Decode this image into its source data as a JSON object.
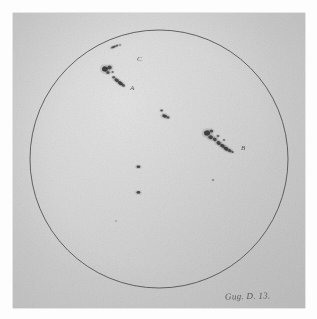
{
  "plate": {
    "kind": "astronomical-drawing",
    "subject": "Solar disk with sunspot groups",
    "paper_tone": "#d2d2d2",
    "ink_color": "#3a3a3a"
  },
  "disk": {
    "label": "solar-disk",
    "center_x": 159,
    "center_y": 159,
    "radius": 129,
    "stroke_color": "#4a4a4a",
    "stroke_width": 0.9
  },
  "annotations": {
    "signature": "Gug. D. 13.",
    "labels": [
      {
        "id": "C",
        "text": "C"
      },
      {
        "id": "A",
        "text": "A"
      },
      {
        "id": "B",
        "text": "B"
      }
    ]
  },
  "chart_data": {
    "type": "scatter",
    "xlabel": "",
    "ylabel": "",
    "xlim": [
      -1,
      1
    ],
    "ylim": [
      -1,
      1
    ],
    "grid": false,
    "legend": "none",
    "disk": {
      "cx": 159,
      "cy": 159,
      "r": 129
    },
    "groups": [
      {
        "name": "C",
        "label": "C",
        "label_x": 124,
        "label_y": 45,
        "spots": [
          {
            "x": 113.5,
            "y": 47.0,
            "rx": 2.6,
            "ry": 1.1,
            "rot": -22,
            "darkness": 0.82
          },
          {
            "x": 117.0,
            "y": 45.6,
            "rx": 1.3,
            "ry": 0.9,
            "rot": -20,
            "darkness": 0.7
          },
          {
            "x": 120.0,
            "y": 45.0,
            "rx": 1.0,
            "ry": 0.8,
            "rot": 0,
            "darkness": 0.6
          }
        ]
      },
      {
        "name": "A",
        "label": "A",
        "label_x": 117,
        "label_y": 74,
        "spots": [
          {
            "x": 105.0,
            "y": 69.0,
            "rx": 3.0,
            "ry": 2.7,
            "rot": 15,
            "darkness": 0.95
          },
          {
            "x": 109.6,
            "y": 67.5,
            "rx": 2.1,
            "ry": 1.9,
            "rot": 0,
            "darkness": 0.88
          },
          {
            "x": 108.0,
            "y": 72.4,
            "rx": 1.7,
            "ry": 1.5,
            "rot": 0,
            "darkness": 0.8
          },
          {
            "x": 112.6,
            "y": 72.0,
            "rx": 1.2,
            "ry": 1.1,
            "rot": 0,
            "darkness": 0.62
          },
          {
            "x": 113.6,
            "y": 77.3,
            "rx": 1.5,
            "ry": 1.2,
            "rot": 0,
            "darkness": 0.7
          },
          {
            "x": 116.6,
            "y": 80.2,
            "rx": 2.4,
            "ry": 1.6,
            "rot": 30,
            "darkness": 0.9
          },
          {
            "x": 120.4,
            "y": 83.2,
            "rx": 2.7,
            "ry": 1.7,
            "rot": 32,
            "darkness": 0.94
          },
          {
            "x": 123.4,
            "y": 85.4,
            "rx": 1.6,
            "ry": 1.3,
            "rot": 30,
            "darkness": 0.8
          }
        ]
      },
      {
        "name": "center",
        "label": "",
        "spots": [
          {
            "x": 161.6,
            "y": 110.5,
            "rx": 1.4,
            "ry": 1.1,
            "rot": 0,
            "darkness": 0.78
          },
          {
            "x": 164.6,
            "y": 116.0,
            "rx": 2.4,
            "ry": 1.7,
            "rot": 18,
            "darkness": 0.92
          },
          {
            "x": 168.0,
            "y": 117.4,
            "rx": 1.5,
            "ry": 1.2,
            "rot": 10,
            "darkness": 0.78
          }
        ]
      },
      {
        "name": "B",
        "label": "B",
        "label_x": 228,
        "label_y": 134,
        "spots": [
          {
            "x": 207.0,
            "y": 133.0,
            "rx": 3.1,
            "ry": 2.7,
            "rot": -15,
            "darkness": 0.95
          },
          {
            "x": 211.4,
            "y": 131.0,
            "rx": 1.8,
            "ry": 1.5,
            "rot": 0,
            "darkness": 0.82
          },
          {
            "x": 210.6,
            "y": 137.2,
            "rx": 2.4,
            "ry": 2.0,
            "rot": 10,
            "darkness": 0.9
          },
          {
            "x": 214.8,
            "y": 139.4,
            "rx": 2.0,
            "ry": 1.7,
            "rot": 20,
            "darkness": 0.86
          },
          {
            "x": 218.0,
            "y": 136.0,
            "rx": 1.3,
            "ry": 1.1,
            "rot": 0,
            "darkness": 0.66
          },
          {
            "x": 218.6,
            "y": 143.0,
            "rx": 2.2,
            "ry": 1.8,
            "rot": 25,
            "darkness": 0.9
          },
          {
            "x": 222.4,
            "y": 145.8,
            "rx": 2.4,
            "ry": 1.7,
            "rot": 28,
            "darkness": 0.92
          },
          {
            "x": 226.0,
            "y": 148.6,
            "rx": 2.6,
            "ry": 1.8,
            "rot": 30,
            "darkness": 0.94
          },
          {
            "x": 229.6,
            "y": 150.6,
            "rx": 2.0,
            "ry": 1.5,
            "rot": 28,
            "darkness": 0.85
          },
          {
            "x": 232.4,
            "y": 152.0,
            "rx": 1.3,
            "ry": 1.0,
            "rot": 20,
            "darkness": 0.7
          },
          {
            "x": 224.0,
            "y": 140.0,
            "rx": 1.1,
            "ry": 0.9,
            "rot": 0,
            "darkness": 0.58
          }
        ]
      },
      {
        "name": "isolated",
        "label": "",
        "spots": [
          {
            "x": 138.4,
            "y": 166.8,
            "rx": 1.9,
            "ry": 1.3,
            "rot": 0,
            "darkness": 0.9
          },
          {
            "x": 138.4,
            "y": 192.4,
            "rx": 1.9,
            "ry": 1.3,
            "rot": 0,
            "darkness": 0.88
          },
          {
            "x": 213.0,
            "y": 180.0,
            "rx": 1.0,
            "ry": 0.9,
            "rot": 0,
            "darkness": 0.45
          },
          {
            "x": 116.0,
            "y": 221.0,
            "rx": 0.8,
            "ry": 0.7,
            "rot": 0,
            "darkness": 0.35
          }
        ]
      }
    ]
  }
}
